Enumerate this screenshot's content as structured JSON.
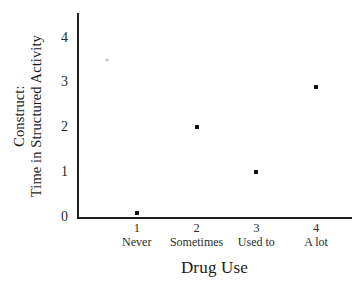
{
  "chart_data": {
    "type": "scatter",
    "title": "",
    "xlabel": "Drug Use",
    "ylabel_lines": [
      "Construct:",
      "Time in Structured Activity"
    ],
    "ylabel": "Construct: Time in Structured Activity",
    "xlim": [
      0,
      4.6
    ],
    "ylim": [
      0,
      4.55
    ],
    "grid": false,
    "legend": "none",
    "x_ticks": [
      1,
      2,
      3,
      4
    ],
    "x_tick_labels": [
      "1",
      "2",
      "3",
      "4"
    ],
    "x_categories": [
      "Never",
      "Sometimes",
      "Used to",
      "A lot"
    ],
    "y_ticks": [
      0,
      1,
      2,
      3,
      4
    ],
    "y_tick_labels": [
      "0",
      "1",
      "2",
      "3",
      "4"
    ],
    "points": [
      {
        "x": 0.5,
        "y": 3.5,
        "style": "faint"
      },
      {
        "x": 1,
        "y": 0.1,
        "style": "solid"
      },
      {
        "x": 2,
        "y": 2.0,
        "style": "solid"
      },
      {
        "x": 3,
        "y": 1.0,
        "style": "solid"
      },
      {
        "x": 4,
        "y": 2.9,
        "style": "solid"
      }
    ],
    "marker_color": "#111111",
    "faint_marker_color": "#c9c9c9",
    "axis_color": "#202020"
  }
}
